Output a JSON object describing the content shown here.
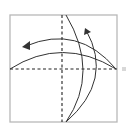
{
  "diagram": {
    "type": "origami-fold-diagram",
    "colors": {
      "background": "#ffffff",
      "paper_border": "#b8b8b8",
      "line": "#333333",
      "dashed_line": "#222222",
      "marker": "#d8d8d8"
    },
    "paper": {
      "x": 10,
      "y": 15,
      "width": 107,
      "height": 107
    },
    "valley_folds": [
      {
        "name": "horizontal-center-fold",
        "x1": 10,
        "y1": 69,
        "x2": 117,
        "y2": 69
      },
      {
        "name": "vertical-center-fold",
        "x1": 62,
        "y1": 15,
        "x2": 62,
        "y2": 122
      }
    ],
    "curves": [
      {
        "name": "lower-horizontal-curve",
        "d": "M10 69 Q62 36 116 69"
      },
      {
        "name": "upper-arrow-curve",
        "d": "M116 69 Q78 24 26 46"
      },
      {
        "name": "outer-vertical-curve",
        "d": "M66 15 Q100 72 66 122"
      },
      {
        "name": "inner-arrow-curve",
        "d": "M66 122 Q114 80 86 30"
      }
    ],
    "arrowheads": [
      {
        "name": "left-arrowhead",
        "points": "22,47 30,41 30,50"
      },
      {
        "name": "top-arrowhead",
        "points": "85,28 91,32 84,35"
      }
    ],
    "side_marker": {
      "x": 122,
      "y": 67,
      "size": 4
    }
  }
}
